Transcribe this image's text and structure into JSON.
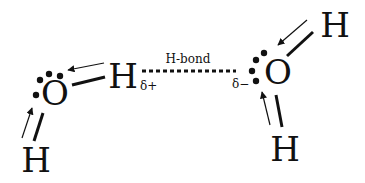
{
  "diagram": {
    "type": "chemistry-structure",
    "colors": {
      "ink": "#111111",
      "background": "#ffffff"
    },
    "left_molecule": {
      "oxygen": {
        "symbol": "O",
        "x": 55,
        "y": 105
      },
      "hydrogen_top": {
        "symbol": "H",
        "x": 123,
        "y": 88
      },
      "hydrogen_bottom": {
        "symbol": "H",
        "x": 36,
        "y": 172
      },
      "partial_charge": {
        "label": "δ+",
        "x": 150,
        "y": 90
      }
    },
    "right_molecule": {
      "oxygen": {
        "symbol": "O",
        "x": 277,
        "y": 84
      },
      "hydrogen_top": {
        "symbol": "H",
        "x": 335,
        "y": 37
      },
      "hydrogen_bottom": {
        "symbol": "H",
        "x": 285,
        "y": 161
      },
      "partial_charge": {
        "label": "δ−",
        "x": 243,
        "y": 88
      }
    },
    "hydrogen_bond": {
      "label": "H-bond",
      "x": 188,
      "y": 62,
      "style": "dotted"
    }
  }
}
